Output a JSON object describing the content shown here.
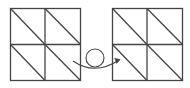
{
  "diagram": {
    "colors": {
      "line": "#444444",
      "background": "#ffffff"
    },
    "left_grid": {
      "rows": 2,
      "cols": 2,
      "diagonal": "top-left to bottom-right in each cell"
    },
    "right_grid": {
      "rows": 2,
      "cols": 2,
      "diagonal": "top-left to bottom-right in each cell"
    },
    "connector": {
      "type": "curved arrow with loop",
      "direction": "left-to-right"
    }
  }
}
